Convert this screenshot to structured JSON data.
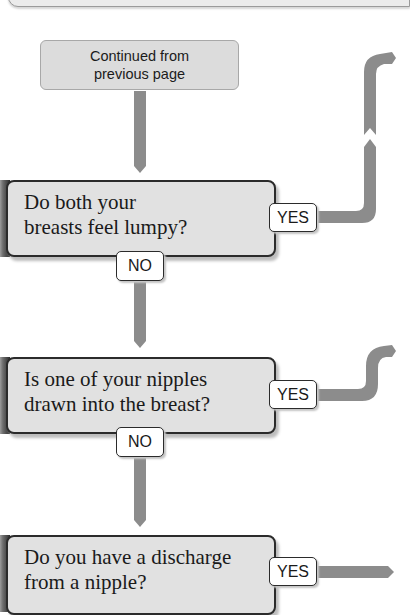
{
  "flowchart": {
    "start": {
      "line1": "Continued from",
      "line2": "previous page"
    },
    "questions": [
      {
        "line1": "Do both your",
        "line2": "breasts feel lumpy?",
        "yes_label": "YES",
        "no_label": "NO"
      },
      {
        "line1": "Is one of your nipples",
        "line2": "drawn into the breast?",
        "yes_label": "YES",
        "no_label": "NO"
      },
      {
        "line1": "Do you have a discharge",
        "line2": "from a nipple?",
        "yes_label": "YES"
      }
    ],
    "colors": {
      "connector": "#8c8c8c",
      "question_fill": "#e1e1e1",
      "start_fill": "#dcdcdc",
      "border": "#2b2b2b"
    }
  }
}
